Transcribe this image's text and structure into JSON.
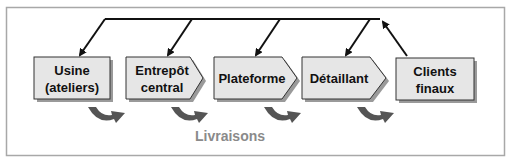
{
  "diagram": {
    "nodes": [
      {
        "id": "usine",
        "line1": "Usine",
        "line2": "(ateliers)",
        "shape": "rect"
      },
      {
        "id": "entrepot",
        "line1": "Entrepôt",
        "line2": "central",
        "shape": "pentagon"
      },
      {
        "id": "plateforme",
        "line1": "Plateforme",
        "line2": "",
        "shape": "pentagon"
      },
      {
        "id": "detaillant",
        "line1": "Détaillant",
        "line2": "",
        "shape": "pentagon"
      },
      {
        "id": "clients",
        "line1": "Clients",
        "line2": "finaux",
        "shape": "rect"
      }
    ],
    "flow_label": "Livraisons",
    "colors": {
      "box_fill": "#e6e6e6",
      "box_stroke": "#333333",
      "shadow": "#9a9a9a",
      "curve_arrow": "#555555",
      "frame": "#a0a0a0",
      "label_gray": "#8a8a8a"
    }
  }
}
